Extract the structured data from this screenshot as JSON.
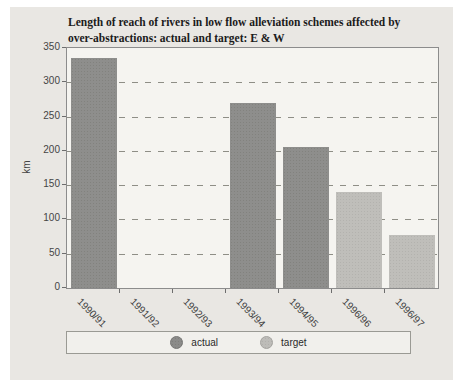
{
  "title": {
    "line1": "Length of reach of rivers in low flow alleviation schemes affected by",
    "line2": "over-abstractions: actual and target: E & W"
  },
  "chart_data": {
    "type": "bar",
    "title": "Length of reach of rivers in low flow alleviation schemes affected by over-abstractions: actual and target: E & W",
    "xlabel": "",
    "ylabel": "km",
    "ylim": [
      0,
      350
    ],
    "ytick_step": 50,
    "yticks": [
      0,
      50,
      100,
      150,
      200,
      250,
      300,
      350
    ],
    "categories": [
      "1990/91",
      "1991/92",
      "1992/93",
      "1993/94",
      "1994/95",
      "1996/96",
      "1996/97"
    ],
    "series": [
      {
        "name": "actual",
        "color": "#8e8e8c",
        "values": [
          335,
          null,
          null,
          270,
          205,
          null,
          null
        ]
      },
      {
        "name": "target",
        "color": "#bfbeba",
        "values": [
          null,
          null,
          null,
          null,
          null,
          140,
          77
        ]
      }
    ],
    "grid": "horizontal dashed lines every 50",
    "legend_position": "bottom"
  },
  "legend": {
    "items": [
      {
        "label": "actual",
        "color": "#8b8b89"
      },
      {
        "label": "target",
        "color": "#bdbcb8"
      }
    ]
  },
  "colors": {
    "panel_bg": "#e9e7e3",
    "plot_bg": "#f5f4f0",
    "plot_border": "#8c8c8c",
    "gridline": "#8e8e86",
    "actual_bar": "#8e8e8c",
    "target_bar": "#bfbeba",
    "title_text": "#1b1b1b",
    "axis_text": "#454545"
  }
}
